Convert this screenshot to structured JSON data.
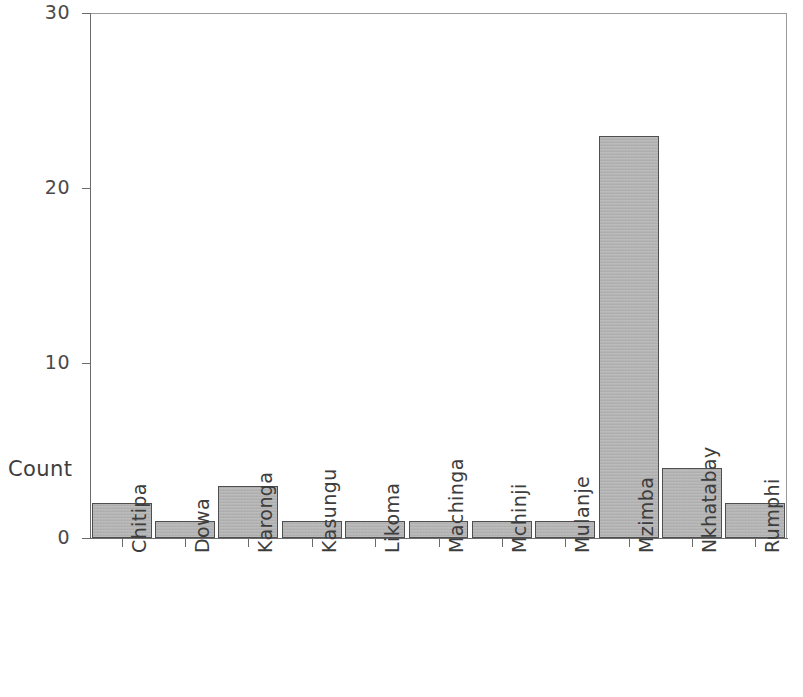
{
  "chart_data": {
    "type": "bar",
    "title": "",
    "subtitle": "",
    "xlabel": "",
    "ylabel": "Count",
    "categories": [
      "Chitipa",
      "Dowa",
      "Karonga",
      "Kasungu",
      "Likoma",
      "Machinga",
      "Mchinji",
      "Mulanje",
      "Mzimba",
      "Nkhatabay",
      "Rumphi"
    ],
    "values": [
      2,
      1,
      3,
      1,
      1,
      1,
      1,
      1,
      23,
      4,
      2
    ],
    "ylim": [
      0,
      30
    ],
    "y_ticks": [
      0,
      10,
      20,
      30
    ],
    "y_tick_labels": [
      "0",
      "10",
      "20",
      "30"
    ],
    "grid": false,
    "legend": null,
    "bar_color": "#b3b3b3",
    "bar_border_color": "#4f4f4f",
    "axis_color": "#6b6b6b"
  }
}
